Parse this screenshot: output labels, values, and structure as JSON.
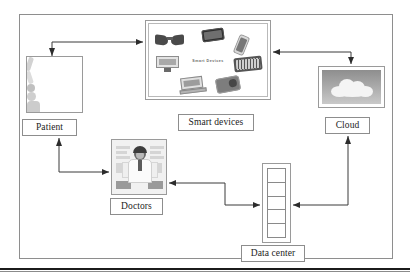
{
  "diagram": {
    "nodes": [
      {
        "id": "patient",
        "label": "Patient",
        "icon": "patient-illustration"
      },
      {
        "id": "smart",
        "label": "Smart devices",
        "icon": "smart-devices-collage",
        "inner_text": "Smart Devices"
      },
      {
        "id": "cloud",
        "label": "Cloud",
        "icon": "cloud-illustration"
      },
      {
        "id": "doctors",
        "label": "Doctors",
        "icon": "doctor-illustration"
      },
      {
        "id": "datacenter",
        "label": "Data center",
        "icon": "server-rack",
        "slots": 5
      }
    ],
    "edges": [
      {
        "id": "patient-to-smart",
        "from": "Patient",
        "to": "Smart devices",
        "bidirectional": true
      },
      {
        "id": "smart-to-cloud",
        "from": "Smart devices",
        "to": "Cloud",
        "bidirectional": true
      },
      {
        "id": "patient-to-doctors",
        "from": "Patient",
        "to": "Doctors",
        "bidirectional": true
      },
      {
        "id": "doctors-to-datacenter",
        "from": "Doctors",
        "to": "Data center",
        "bidirectional": true
      },
      {
        "id": "cloud-to-datacenter",
        "from": "Cloud",
        "to": "Data center",
        "bidirectional": true
      }
    ],
    "colors": {
      "frame_border": "#8e8e8e",
      "caption_border": "#8d8d8d",
      "arrow": "#3a3a3a",
      "text": "#1c1c1c",
      "rule": "#1b1b1b"
    }
  }
}
